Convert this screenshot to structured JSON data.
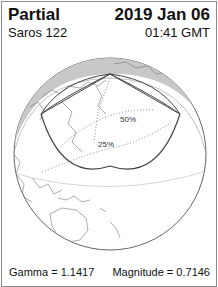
{
  "header": {
    "eclipse_type": "Partial",
    "date": "2019 Jan 06",
    "saros": "Saros 122",
    "time": "01:41 GMT"
  },
  "map": {
    "contour_labels": [
      "50%",
      "25%"
    ],
    "colors": {
      "night_shade": "#c8c8c8",
      "globe_fill": "#ffffff",
      "outline": "#555555",
      "eclipse_limits": "#444444",
      "contour_dots": "#888888",
      "coastline": "#777777"
    }
  },
  "footer": {
    "gamma": "Gamma = 1.1417",
    "magnitude": "Magnitude = 0.7146"
  }
}
